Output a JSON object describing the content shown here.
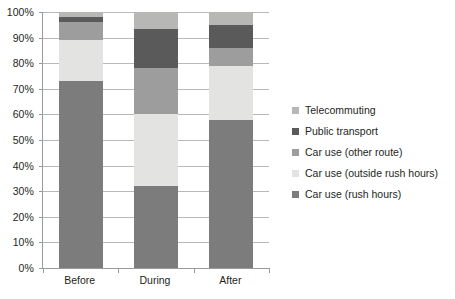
{
  "chart_data": {
    "type": "bar",
    "subtype": "stacked-percentage",
    "title": "",
    "xlabel": "",
    "ylabel": "",
    "ylim": [
      0,
      100
    ],
    "grid": true,
    "legend_position": "right",
    "categories": [
      "Before",
      "During",
      "After"
    ],
    "y_ticks": [
      "0%",
      "10%",
      "20%",
      "30%",
      "40%",
      "50%",
      "60%",
      "70%",
      "80%",
      "90%",
      "100%"
    ],
    "y_tick_values": [
      0,
      10,
      20,
      30,
      40,
      50,
      60,
      70,
      80,
      90,
      100
    ],
    "series": [
      {
        "name": "Car use (rush hours)",
        "color": "#7c7c7c",
        "values": [
          73,
          32,
          58
        ]
      },
      {
        "name": "Car use (outside rush hours)",
        "color": "#e3e3e1",
        "values": [
          16,
          28,
          21
        ]
      },
      {
        "name": "Car use (other route)",
        "color": "#9d9d9d",
        "values": [
          7,
          18,
          7
        ]
      },
      {
        "name": "Public transport",
        "color": "#5a5a5a",
        "values": [
          2,
          15.5,
          9
        ]
      },
      {
        "name": "Telecommuting",
        "color": "#b7b7b5",
        "values": [
          2,
          6.5,
          5
        ]
      }
    ],
    "legend_entries": [
      {
        "label": "Telecommuting",
        "color": "#b7b7b5"
      },
      {
        "label": "Public transport",
        "color": "#5a5a5a"
      },
      {
        "label": "Car use (other route)",
        "color": "#9d9d9d"
      },
      {
        "label": "Car use (outside rush hours)",
        "color": "#e3e3e1"
      },
      {
        "label": "Car use (rush hours)",
        "color": "#7c7c7c"
      }
    ],
    "colors": {
      "axis": "#9a9a9a",
      "gridline": "#b9b9b9",
      "text": "#231f20",
      "background": "#ffffff"
    }
  }
}
